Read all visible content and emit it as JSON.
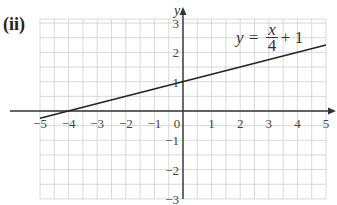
{
  "part_label": "(ii)",
  "chart_data": {
    "type": "line",
    "title": "",
    "xlabel": "x",
    "ylabel": "y",
    "xlim": [
      -5,
      5
    ],
    "ylim": [
      -3,
      3
    ],
    "grid": true,
    "grid_step": 0.5,
    "x_ticks": [
      -5,
      -4,
      -3,
      -2,
      -1,
      0,
      1,
      2,
      3,
      4,
      5
    ],
    "x_tick_labels": [
      "−5",
      "−4",
      "−3",
      "−2",
      "−1",
      "0",
      "1",
      "2",
      "3",
      "4",
      "5"
    ],
    "y_ticks": [
      -3,
      -2,
      -1,
      1,
      2,
      3
    ],
    "y_tick_labels": [
      "−3",
      "−2",
      "−1",
      "1",
      "2",
      "3"
    ],
    "series": [
      {
        "name": "y = x/4 + 1",
        "equation": "y = x/4 + 1",
        "x": [
          -5,
          5
        ],
        "y": [
          -0.25,
          2.25
        ],
        "color": "#222222"
      }
    ],
    "annotations": [
      {
        "text": "y = x/4 + 1",
        "x": 2.2,
        "y": 2.6
      }
    ]
  },
  "equation_label": {
    "lhs": "y =",
    "numerator": "x",
    "denominator": "4",
    "rhs": "+ 1"
  }
}
